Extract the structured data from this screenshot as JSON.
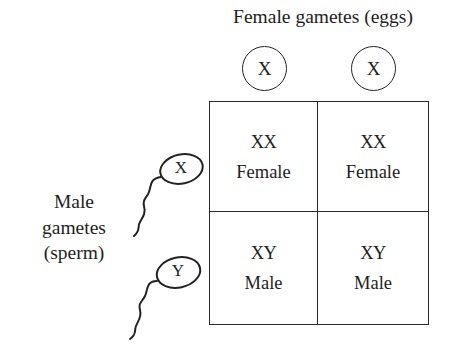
{
  "diagram": {
    "type": "punnett-square",
    "female_gametes": {
      "title": "Female gametes (eggs)",
      "eggs": [
        {
          "chromosome": "X"
        },
        {
          "chromosome": "X"
        }
      ]
    },
    "male_gametes": {
      "label_lines": [
        "Male",
        "gametes",
        "(sperm)"
      ],
      "sperm": [
        {
          "chromosome": "X"
        },
        {
          "chromosome": "Y"
        }
      ]
    },
    "grid": {
      "rows": [
        [
          {
            "genotype": "XX",
            "sex": "Female"
          },
          {
            "genotype": "XX",
            "sex": "Female"
          }
        ],
        [
          {
            "genotype": "XY",
            "sex": "Male"
          },
          {
            "genotype": "XY",
            "sex": "Male"
          }
        ]
      ]
    },
    "colors": {
      "stroke": "#222222",
      "text": "#1e1e1e",
      "background": "#ffffff"
    }
  }
}
